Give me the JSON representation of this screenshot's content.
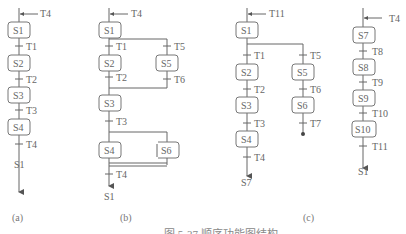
{
  "diagram": {
    "type": "sequential-function-chart",
    "panels": [
      {
        "label": "(a)",
        "entry_transition": "T4",
        "steps": [
          "S1",
          "S2",
          "S3",
          "S4"
        ],
        "transitions": [
          "T1",
          "T2",
          "T3",
          "T4"
        ],
        "exit_target": "S1"
      },
      {
        "label": "(b)",
        "entry_transition": "T4",
        "steps": [
          "S1",
          "S2",
          "S5",
          "S3",
          "S4",
          "S6"
        ],
        "transitions": [
          "T1",
          "T5",
          "T2",
          "T6",
          "T3",
          "T4"
        ],
        "exit_target": "S1"
      },
      {
        "label": "(c)",
        "entry_transition": "T11",
        "steps": [
          "S1",
          "S2",
          "S5",
          "S3",
          "S6",
          "S4"
        ],
        "transitions": [
          "T1",
          "T5",
          "T2",
          "T6",
          "T3",
          "T7",
          "T4"
        ],
        "exit_target": "S7"
      },
      {
        "label": "",
        "entry_transition": "T4",
        "steps": [
          "S7",
          "S8",
          "S9",
          "S10"
        ],
        "transitions": [
          "T8",
          "T9",
          "T10",
          "T11"
        ],
        "exit_target": "S1"
      }
    ],
    "caption": "图 5-37 顺序功能图结构"
  }
}
